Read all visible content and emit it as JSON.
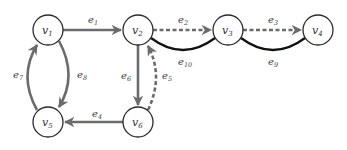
{
  "diagram": {
    "type": "directed-graph",
    "colors": {
      "solid_edge": "#6b6b6b",
      "dashed_edge": "#6b6b6b",
      "black_edge": "#111111",
      "node_stroke": "#2a2a2a",
      "background": "#ffffff"
    },
    "nodes": [
      {
        "id": "v1",
        "base": "v",
        "sub": "1",
        "x": 48,
        "y": 30
      },
      {
        "id": "v2",
        "base": "v",
        "sub": "2",
        "x": 138,
        "y": 30
      },
      {
        "id": "v3",
        "base": "v",
        "sub": "3",
        "x": 228,
        "y": 30
      },
      {
        "id": "v4",
        "base": "v",
        "sub": "4",
        "x": 318,
        "y": 30
      },
      {
        "id": "v5",
        "base": "v",
        "sub": "5",
        "x": 48,
        "y": 122
      },
      {
        "id": "v6",
        "base": "v",
        "sub": "6",
        "x": 138,
        "y": 122
      }
    ],
    "edges": [
      {
        "id": "e1",
        "base": "e",
        "sub": "1",
        "from": "v1",
        "to": "v2",
        "style": "solid-gray-arrow"
      },
      {
        "id": "e2",
        "base": "e",
        "sub": "2",
        "from": "v2",
        "to": "v3",
        "style": "dashed-gray-arrow"
      },
      {
        "id": "e3",
        "base": "e",
        "sub": "3",
        "from": "v3",
        "to": "v4",
        "style": "dashed-gray-arrow"
      },
      {
        "id": "e4",
        "base": "e",
        "sub": "4",
        "from": "v6",
        "to": "v5",
        "style": "solid-gray-arrow"
      },
      {
        "id": "e5",
        "base": "e",
        "sub": "5",
        "from": "v6",
        "to": "v2",
        "style": "dashed-gray-arrow-curved"
      },
      {
        "id": "e6",
        "base": "e",
        "sub": "6",
        "from": "v2",
        "to": "v6",
        "style": "solid-gray-arrow"
      },
      {
        "id": "e7",
        "base": "e",
        "sub": "7",
        "from": "v5",
        "to": "v1",
        "style": "solid-gray-arrow-curved"
      },
      {
        "id": "e8",
        "base": "e",
        "sub": "8",
        "from": "v1",
        "to": "v5",
        "style": "solid-gray-arrow-curved"
      },
      {
        "id": "e9",
        "base": "e",
        "sub": "9",
        "from": "v3",
        "to": "v4",
        "style": "solid-black-curved"
      },
      {
        "id": "e10",
        "base": "e",
        "sub": "10",
        "from": "v2",
        "to": "v3",
        "style": "solid-black-curved"
      }
    ]
  }
}
